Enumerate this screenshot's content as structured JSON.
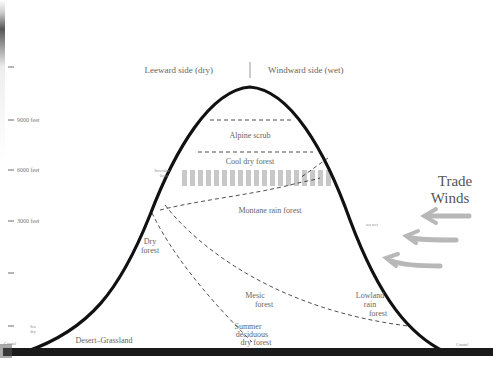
{
  "header": {
    "leeward": "Leeward side (dry)",
    "windward": "Windward side (wet)"
  },
  "elevation_ticks": [
    {
      "label": "9000 feet",
      "y": 120
    },
    {
      "label": "6000 feet",
      "y": 170
    },
    {
      "label": "3000 feet",
      "y": 221
    },
    {
      "label": "",
      "y": 273
    },
    {
      "label": "",
      "y": 326
    }
  ],
  "zones": {
    "alpine_scrub": "Alpine scrub",
    "cool_dry_forest": "Cool dry forest",
    "inversion_layer": [
      "Inversion",
      "layer"
    ],
    "montane_rain_forest": "Montane rain forest",
    "dry_forest": [
      "Dry",
      "forest"
    ],
    "mesic_forest": [
      "Mesic",
      "forest"
    ],
    "lowland_rain_forest": [
      "Lowland",
      "rain",
      "forest"
    ],
    "summer_deciduous": [
      "Summer",
      "deciduous",
      "dry forest"
    ],
    "desert_grassland": "Desert–Grassland",
    "sea_level_left": "Coastal",
    "sea_level_right": "Coastal",
    "sea_dry": [
      "Sea",
      "dry"
    ],
    "sea_wet": "sea wet"
  },
  "trade_winds": {
    "line1": "Trade",
    "line2": "Winds"
  },
  "colors": {
    "mountain": "#111111",
    "ground": "#1a1a1a",
    "inversion": "#c8c8c8",
    "arrows": "#b8b8b8",
    "text": "#666666"
  }
}
